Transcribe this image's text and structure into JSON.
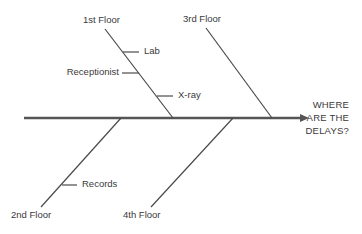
{
  "diagram": {
    "type": "fishbone",
    "effect": {
      "lines": [
        "WHERE",
        "ARE THE",
        "DELAYS?"
      ]
    },
    "categories": [
      {
        "label": "1st Floor",
        "position": "top",
        "causes": [
          "Lab",
          "Receptionist",
          "X-ray"
        ]
      },
      {
        "label": "3rd Floor",
        "position": "top",
        "causes": []
      },
      {
        "label": "2nd Floor",
        "position": "bottom",
        "causes": [
          "Records"
        ]
      },
      {
        "label": "4th Floor",
        "position": "bottom",
        "causes": []
      }
    ],
    "colors": {
      "spine": "#555555",
      "bone": "#4a4a4a",
      "text": "#3a3a3a",
      "background": "#ffffff"
    }
  }
}
